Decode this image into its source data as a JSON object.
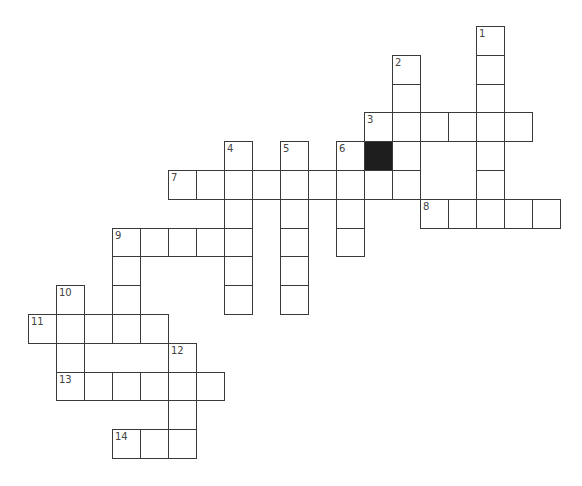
{
  "puzzle": {
    "type": "crossword",
    "origin_x": 28,
    "origin_y": 26,
    "cell_w": 28,
    "cell_h": 28.8,
    "colors": {
      "line": "#3a3a3a",
      "blank": "#ffffff",
      "black": "#1e1e1e",
      "number": "#444444"
    },
    "black_cells": [
      {
        "row": 4,
        "col": 12
      }
    ],
    "entries": [
      {
        "number": "1",
        "direction": "down",
        "row": 0,
        "col": 16,
        "length": 7
      },
      {
        "number": "2",
        "direction": "down",
        "row": 1,
        "col": 13,
        "length": 5
      },
      {
        "number": "3",
        "direction": "across",
        "row": 3,
        "col": 12,
        "length": 6
      },
      {
        "number": "4",
        "direction": "down",
        "row": 4,
        "col": 7,
        "length": 6
      },
      {
        "number": "5",
        "direction": "down",
        "row": 4,
        "col": 9,
        "length": 6
      },
      {
        "number": "6",
        "direction": "down",
        "row": 4,
        "col": 11,
        "length": 4
      },
      {
        "number": "7",
        "direction": "across",
        "row": 5,
        "col": 5,
        "length": 9
      },
      {
        "number": "8",
        "direction": "across",
        "row": 6,
        "col": 14,
        "length": 5
      },
      {
        "number": "9",
        "direction": "across",
        "row": 7,
        "col": 3,
        "length": 5
      },
      {
        "number": "9",
        "direction": "down",
        "row": 7,
        "col": 3,
        "length": 4
      },
      {
        "number": "10",
        "direction": "down",
        "row": 9,
        "col": 1,
        "length": 4
      },
      {
        "number": "11",
        "direction": "across",
        "row": 10,
        "col": 0,
        "length": 5
      },
      {
        "number": "12",
        "direction": "down",
        "row": 11,
        "col": 5,
        "length": 4
      },
      {
        "number": "13",
        "direction": "across",
        "row": 12,
        "col": 1,
        "length": 6
      },
      {
        "number": "14",
        "direction": "across",
        "row": 14,
        "col": 3,
        "length": 3
      }
    ]
  }
}
